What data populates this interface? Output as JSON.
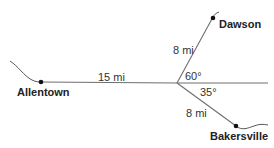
{
  "diagram": {
    "type": "map-route",
    "cities": [
      {
        "id": "allentown",
        "name": "Allentown"
      },
      {
        "id": "dawson",
        "name": "Dawson"
      },
      {
        "id": "bakersville",
        "name": "Bakersville"
      }
    ],
    "segments": [
      {
        "from": "allentown",
        "to": "junction",
        "label": "15 mi",
        "distance_mi": 15
      },
      {
        "from": "junction",
        "to": "dawson",
        "label": "8 mi",
        "distance_mi": 8
      },
      {
        "from": "junction",
        "to": "bakersville",
        "label": "8 mi",
        "distance_mi": 8
      }
    ],
    "angles": [
      {
        "between": [
          "east-line",
          "junction-dawson"
        ],
        "label": "60°",
        "degrees": 60
      },
      {
        "between": [
          "east-line",
          "junction-bakersville"
        ],
        "label": "35°",
        "degrees": 35
      }
    ]
  }
}
